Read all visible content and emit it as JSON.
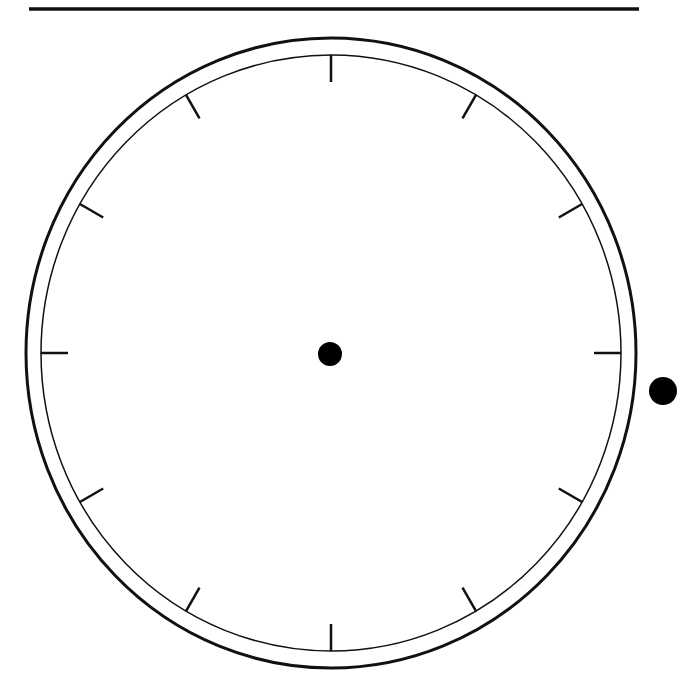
{
  "diagram": {
    "type": "blank-clock-face",
    "colors": {
      "background": "#ffffff",
      "stroke": "#111111",
      "fill_dot": "#000000"
    },
    "top_rule": {
      "x1": 29,
      "x2": 639,
      "y": 9,
      "width": 3.5
    },
    "outer_ring": {
      "cx": 331,
      "cy": 353,
      "rx": 305,
      "ry": 315,
      "stroke_width": 3
    },
    "inner_ring": {
      "cx": 331,
      "cy": 353,
      "rx": 290,
      "ry": 298,
      "stroke_width": 1.5
    },
    "center_dot": {
      "cx": 330,
      "cy": 354,
      "r": 12
    },
    "side_knob": {
      "cx": 663,
      "cy": 391,
      "r": 14
    },
    "ticks": {
      "count": 12,
      "length": 27,
      "stroke_width": 2.5,
      "hour_positions": [
        12,
        1,
        2,
        3,
        4,
        5,
        6,
        7,
        8,
        9,
        10,
        11
      ]
    }
  }
}
